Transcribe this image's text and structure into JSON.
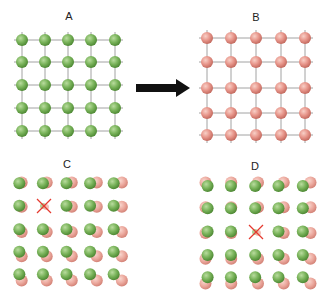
{
  "colors": {
    "green": "#79b35a",
    "green_light": "#a9d48c",
    "green_dark": "#4f8a35",
    "pink": "#e7958a",
    "pink_light": "#f5c2b8",
    "pink_dark": "#c46b60",
    "grid_line": "#8a8a8a",
    "arrow": "#111111",
    "vacancy_cross": "#e53a2f"
  },
  "panels": [
    {
      "id": "A",
      "label": "A",
      "label_pos": [
        69,
        20
      ],
      "type": "lattice",
      "atom_color": "green",
      "xs": [
        22,
        45,
        68,
        91,
        115
      ],
      "ys": [
        40,
        62,
        85,
        108,
        131
      ],
      "atom_radius": 6
    },
    {
      "id": "B",
      "label": "B",
      "label_pos": [
        256,
        21
      ],
      "type": "lattice",
      "atom_color": "pink",
      "xs": [
        207,
        231,
        256,
        281,
        305
      ],
      "ys": [
        38,
        62,
        88,
        113,
        135
      ],
      "atom_radius": 6
    },
    {
      "id": "C",
      "label": "C",
      "label_pos": [
        67,
        168
      ],
      "type": "displaced-pairs",
      "xs": [
        20,
        44,
        68,
        92,
        116
      ],
      "ys": [
        183,
        206,
        230,
        253,
        276
      ],
      "vacancy": [
        1,
        1
      ],
      "atom_radius": 6
    },
    {
      "id": "D",
      "label": "D",
      "label_pos": [
        255,
        170
      ],
      "type": "displaced-pairs",
      "xs": [
        207,
        231,
        256,
        280,
        305
      ],
      "ys": [
        185,
        208,
        232,
        256,
        279
      ],
      "vacancy": [
        2,
        2
      ],
      "atom_radius": 6
    }
  ],
  "arrow": {
    "from": [
      136,
      88
    ],
    "to": [
      190,
      88
    ],
    "direction": "right"
  }
}
